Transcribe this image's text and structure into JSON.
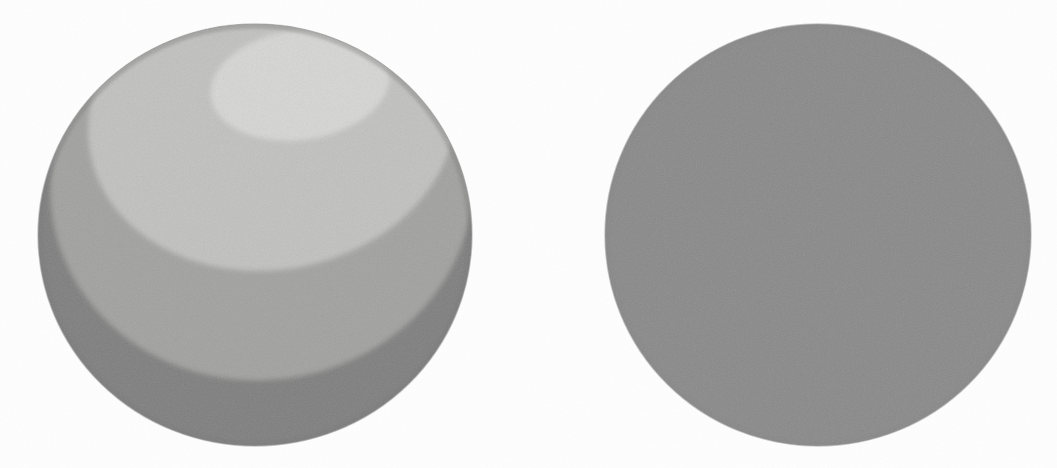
{
  "figure": {
    "background_color": "#fefefe",
    "width": 1057,
    "height": 468,
    "medium": "scanned halftone print, visible paper grain",
    "caption": ""
  },
  "objects": [
    {
      "id": "left-sphere",
      "name": "banded-shaded-sphere",
      "description": "Sphere rendered with quantized / posterized diffuse shading producing discrete terminator bands",
      "shape": "circle",
      "center_x": 255,
      "center_y": 235,
      "radius_x": 217,
      "radius_y": 211,
      "bounds": {
        "left": 38,
        "top": 24,
        "right": 472,
        "bottom": 446
      },
      "light_direction": "upper-right, slightly front",
      "shading_model": "flat / banded (toon)",
      "band_count": 4,
      "bands": [
        {
          "index": 0,
          "label": "specular highlight cap",
          "color": "#d8d8d6",
          "center_x": 300,
          "center_y": 85,
          "radius_x": 90,
          "radius_y": 55,
          "rotation_deg": -8
        },
        {
          "index": 1,
          "label": "lit band",
          "color": "#c3c3c1",
          "center_x": 272,
          "center_y": 120,
          "radius_x": 185,
          "radius_y": 150,
          "rotation_deg": -10
        },
        {
          "index": 2,
          "label": "mid-tone band",
          "color": "#a3a3a1",
          "center_x": 262,
          "center_y": 185,
          "radius_x": 212,
          "radius_y": 195,
          "rotation_deg": -8
        },
        {
          "index": 3,
          "label": "shadow band",
          "color": "#808080",
          "center_x": 255,
          "center_y": 235,
          "radius_x": 217,
          "radius_y": 211,
          "rotation_deg": 0
        }
      ],
      "rim_shadow_color": "#787878"
    },
    {
      "id": "right-sphere",
      "name": "flat-shaded-sphere",
      "description": "Sphere rendered with a single uniform flat gray, no shading gradient",
      "shape": "circle",
      "center_x": 818,
      "center_y": 235,
      "radius_x": 213,
      "radius_y": 211,
      "bounds": {
        "left": 605,
        "top": 24,
        "right": 1031,
        "bottom": 446
      },
      "light_direction": "none / ambient only",
      "shading_model": "uniform flat",
      "band_count": 1,
      "bands": [
        {
          "index": 0,
          "label": "uniform fill",
          "color": "#8b8b8b",
          "center_x": 818,
          "center_y": 235,
          "radius_x": 213,
          "radius_y": 211,
          "rotation_deg": 0
        }
      ],
      "rim_shadow_color": "#868686"
    }
  ],
  "palette": {
    "paper": "#fefefe",
    "highlight": "#d8d8d6",
    "lit": "#c3c3c1",
    "midtone": "#a3a3a1",
    "shadow": "#808080",
    "flat_gray": "#8b8b8b",
    "edge": "#6f6f6f"
  }
}
